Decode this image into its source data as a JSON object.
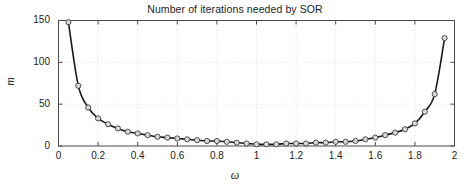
{
  "chart_data": {
    "type": "line",
    "title": "Number of iterations needed by SOR",
    "xlabel": "ω",
    "ylabel": "m",
    "xlim": [
      0,
      2
    ],
    "ylim": [
      0,
      150
    ],
    "grid": true,
    "legend": null,
    "marker": "circle",
    "marker_face_color": "#d9d9d9",
    "marker_edge_color": "#2b2b2b",
    "line_color": "#1a1a1a",
    "xticks": [
      0,
      0.2,
      0.4,
      0.6,
      0.8,
      1,
      1.2,
      1.4,
      1.6,
      1.8,
      2
    ],
    "xtick_labels": [
      "0",
      "0.2",
      "0.4",
      "0.6",
      "0.8",
      "1",
      "1.2",
      "1.4",
      "1.6",
      "1.8",
      "2"
    ],
    "yticks": [
      0,
      50,
      100,
      150
    ],
    "ytick_labels": [
      "0",
      "50",
      "100",
      "150"
    ],
    "x": [
      0.05,
      0.1,
      0.15,
      0.2,
      0.25,
      0.3,
      0.35,
      0.4,
      0.45,
      0.5,
      0.55,
      0.6,
      0.65,
      0.7,
      0.75,
      0.8,
      0.85,
      0.9,
      0.95,
      1.0,
      1.05,
      1.1,
      1.15,
      1.2,
      1.25,
      1.3,
      1.35,
      1.4,
      1.45,
      1.5,
      1.55,
      1.6,
      1.65,
      1.7,
      1.75,
      1.8,
      1.85,
      1.9,
      1.95
    ],
    "values": [
      148,
      72,
      46,
      33,
      26,
      21,
      17,
      15,
      13,
      11,
      10,
      9,
      8,
      7,
      6,
      6,
      5,
      4,
      3,
      2,
      2,
      2,
      3,
      3,
      3,
      4,
      4,
      5,
      5,
      6,
      8,
      10,
      13,
      16,
      20,
      27,
      41,
      62,
      129
    ]
  }
}
